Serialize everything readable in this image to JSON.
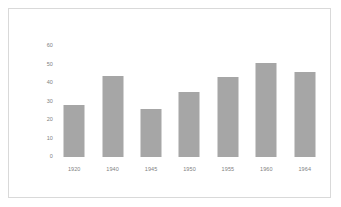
{
  "chart_data": {
    "type": "bar",
    "title": "",
    "subtitle": "",
    "xlabel": "",
    "ylabel": "",
    "categories": [
      "1920",
      "1940",
      "1945",
      "1950",
      "1955",
      "1960",
      "1964"
    ],
    "values": [
      28,
      44,
      26,
      35,
      43,
      51,
      46
    ],
    "series": [
      {
        "name": "",
        "values": [
          28,
          44,
          26,
          35,
          43,
          51,
          46
        ]
      }
    ],
    "ylim": [
      0,
      60
    ],
    "y_ticks": [
      "0",
      "10",
      "20",
      "30",
      "40",
      "50",
      "60"
    ],
    "y_tick_values": [
      0,
      10,
      20,
      30,
      40,
      50,
      60
    ],
    "grid": false,
    "legend": false,
    "legend_position": "none",
    "bar_color": "#a6a6a6",
    "tick_label_color": "#7f7f7f",
    "frame_color": "#d9d9d9",
    "background_color": "#ffffff"
  }
}
